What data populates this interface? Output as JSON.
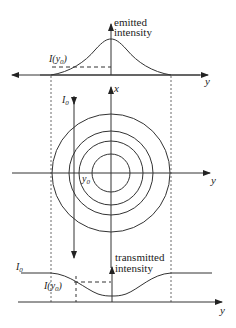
{
  "figure": {
    "top_panel": {
      "ylabel_line1": "emitted",
      "ylabel_line2": "intensity",
      "axis_label": "y",
      "marker_label": "I(y",
      "marker_sub": "0",
      "marker_close": ")"
    },
    "middle_panel": {
      "vertical_axis_label": "x",
      "horizontal_axis_label": "y",
      "beam_label": "I",
      "beam_sub": "0",
      "position_label": "y",
      "position_sub": "0",
      "circle_count": 4
    },
    "bottom_panel": {
      "ylabel_line1": "transmitted",
      "ylabel_line2": "intensity",
      "axis_label": "y",
      "baseline_label": "I",
      "baseline_sub": "0",
      "marker_label": "I(y",
      "marker_sub": "0",
      "marker_close": ")"
    },
    "colors": {
      "line": "#333333",
      "background": "#ffffff"
    }
  }
}
